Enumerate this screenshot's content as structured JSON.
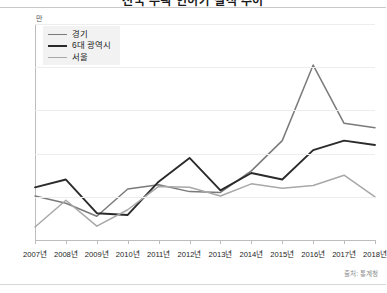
{
  "header": {
    "title": "전국 주택 인허가 실적 추이",
    "title_clipped": true
  },
  "footer": {
    "source": "출처: 통계청"
  },
  "chart_data": {
    "type": "line",
    "title": "전국 주택 인허가 실적 추이",
    "xlabel": "",
    "ylabel": "",
    "yunit": "만",
    "ylim": [
      0,
      50
    ],
    "ytick_step": 10,
    "yticks": [
      0,
      10,
      20,
      30,
      40,
      50
    ],
    "grid": true,
    "legend_position": "top-left",
    "categories": [
      "2007년",
      "2008년",
      "2009년",
      "2010년",
      "2011년",
      "2012년",
      "2013년",
      "2014년",
      "2015년",
      "2016년",
      "2017년",
      "2018년"
    ],
    "series": [
      {
        "name": "경기",
        "color": "#7a7a7a",
        "values": [
          10.2,
          8.5,
          5.5,
          11.8,
          12.8,
          11.2,
          11.0,
          16.0,
          23.0,
          40.5,
          27.0,
          26.0
        ]
      },
      {
        "name": "6대 광역시",
        "color": "#2b2b2b",
        "values": [
          12.2,
          14.0,
          6.2,
          5.8,
          13.5,
          19.0,
          11.5,
          15.5,
          14.0,
          20.8,
          23.0,
          22.0
        ]
      },
      {
        "name": "서울",
        "color": "#a8a8a8",
        "values": [
          3.0,
          9.2,
          3.2,
          7.0,
          12.4,
          12.2,
          10.2,
          13.0,
          12.0,
          12.6,
          15.0,
          10.0
        ]
      }
    ]
  }
}
